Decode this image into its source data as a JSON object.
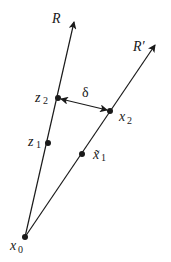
{
  "diagram": {
    "colors": {
      "line": "#1a1a1a",
      "background": "#ffffff"
    },
    "rays": [
      {
        "id": "R",
        "label": "R",
        "from": "x0",
        "to": [
          74,
          22
        ]
      },
      {
        "id": "R-prime",
        "label": "R′",
        "from": "x0",
        "to": [
          155,
          45
        ]
      }
    ],
    "points": {
      "x0": {
        "label": "x",
        "sub": "0",
        "pos": [
          25,
          237
        ]
      },
      "z1": {
        "label": "z",
        "sub": "1",
        "pos": [
          48,
          143
        ]
      },
      "z2": {
        "label": "z",
        "sub": "2",
        "pos": [
          58,
          98
        ]
      },
      "x1tilde": {
        "label": "x̃",
        "sub": "1",
        "pos": [
          82,
          154
        ]
      },
      "x2": {
        "label": "x",
        "sub": "2",
        "pos": [
          110,
          111
        ]
      }
    },
    "distance": {
      "label": "δ",
      "between": [
        "z2",
        "x2"
      ]
    }
  }
}
